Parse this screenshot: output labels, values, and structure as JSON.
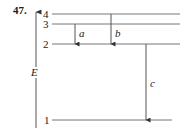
{
  "problem_number": "47.",
  "axis_label": "E",
  "levels": [
    {
      "label": "4",
      "y": 14
    },
    {
      "label": "3",
      "y": 24
    },
    {
      "label": "2",
      "y": 44
    },
    {
      "label": "1",
      "y": 120
    }
  ],
  "transitions": [
    {
      "label": "a",
      "from": "3",
      "to": "2"
    },
    {
      "label": "b",
      "from": "4",
      "to": "2"
    },
    {
      "label": "c",
      "from": "2",
      "to": "1"
    }
  ],
  "colors": {
    "line": "#555555",
    "text": "#222222"
  }
}
